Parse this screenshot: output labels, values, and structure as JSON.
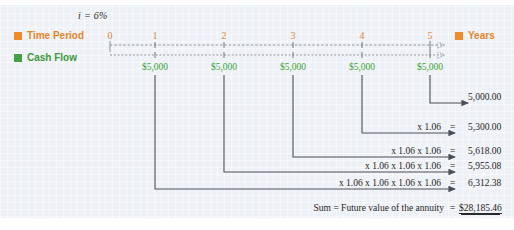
{
  "figure": {
    "interest_rate_label": "i = 6%",
    "row_labels": {
      "time_period": "Time Period",
      "cash_flow": "Cash Flow",
      "years": "Years"
    },
    "colors": {
      "time_period": "#e4852a",
      "cash_flow": "#3c9b3c",
      "background": "#eef1f5",
      "line": "#555a60",
      "text": "#262626"
    },
    "timeline": {
      "periods": [
        "0",
        "1",
        "2",
        "3",
        "4",
        "5"
      ],
      "tick_x": [
        110,
        155,
        224,
        293,
        362,
        430
      ],
      "cash_flows": [
        "",
        "$5,000",
        "$5,000",
        "$5,000",
        "$5,000",
        "$5,000"
      ]
    },
    "rows": [
      {
        "formula": "",
        "equals": "",
        "amount": "5,000.00",
        "from_period": 5,
        "y": 103
      },
      {
        "formula": "x 1.06",
        "equals": "=",
        "amount": "5,300.00",
        "from_period": 4,
        "y": 133
      },
      {
        "formula": "x 1.06 x 1.06",
        "equals": "=",
        "amount": "5,618.00",
        "from_period": 3,
        "y": 157
      },
      {
        "formula": "x 1.06 x 1.06 x 1.06",
        "equals": "=",
        "amount": "5,955.08",
        "from_period": 2,
        "y": 172
      },
      {
        "formula": "x 1.06 x 1.06 x 1.06 x 1.06",
        "equals": "=",
        "amount": "6,312.38",
        "from_period": 1,
        "y": 189
      }
    ],
    "summary": {
      "label": "Sum = Future value of the annuity",
      "equals": "=",
      "value": "$28,185.46"
    }
  }
}
